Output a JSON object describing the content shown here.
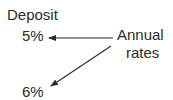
{
  "diagram": {
    "labels": {
      "deposit": "Deposit",
      "rate_1": "5%",
      "rate_2": "6%",
      "source_line1": "Annual",
      "source_line2": "rates"
    },
    "arrows": [
      {
        "from": "Annual rates",
        "to": "5%"
      },
      {
        "from": "Annual rates",
        "to": "6%"
      }
    ],
    "colors": {
      "text": "#2b2b2b",
      "arrow": "#2b2b2b",
      "background": "#ffffff"
    }
  }
}
